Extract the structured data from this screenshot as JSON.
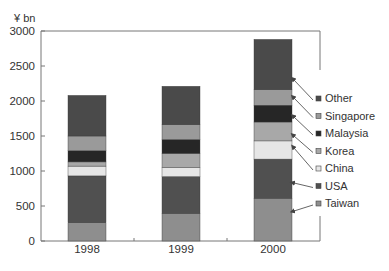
{
  "chart_data": {
    "type": "bar",
    "stacked": true,
    "title": "",
    "unit_label": "¥ bn",
    "xlabel": "",
    "ylabel": "¥ bn",
    "ylim": [
      0,
      3000
    ],
    "yticks": [
      0,
      500,
      1000,
      1500,
      2000,
      2500,
      3000
    ],
    "grid": false,
    "legend_position": "right",
    "categories": [
      "1998",
      "1999",
      "2000"
    ],
    "series": [
      {
        "name": "Taiwan",
        "color": "#8e8e8e",
        "values": [
          260,
          390,
          610
        ]
      },
      {
        "name": "USA",
        "color": "#505050",
        "values": [
          670,
          530,
          560
        ]
      },
      {
        "name": "China",
        "color": "#e6e6e6",
        "values": [
          140,
          130,
          260
        ]
      },
      {
        "name": "Korea",
        "color": "#a8a8a8",
        "values": [
          60,
          200,
          270
        ]
      },
      {
        "name": "Malaysia",
        "color": "#262626",
        "values": [
          160,
          200,
          240
        ]
      },
      {
        "name": "Singapore",
        "color": "#9a9a9a",
        "values": [
          210,
          210,
          220
        ]
      },
      {
        "name": "Other",
        "color": "#4a4a4a",
        "values": [
          580,
          550,
          720
        ]
      }
    ],
    "totals": [
      2080,
      2210,
      2880
    ]
  }
}
